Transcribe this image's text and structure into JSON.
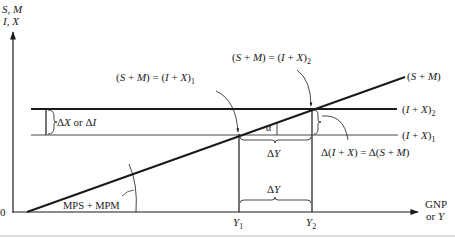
{
  "axes": {
    "y_label_line1": "S, M",
    "y_label_line2": "I, X",
    "x_label_line1": "GNP",
    "x_label_line2": "or Y",
    "origin": "0"
  },
  "lines": {
    "saving_import": "(S + M)",
    "inj_2": "(I + X)",
    "inj_2_sub": "2",
    "inj_1": "(I + X)",
    "inj_1_sub": "1"
  },
  "annotations": {
    "eq1": "(S + M) = (I + X)",
    "eq1_sub": "1",
    "eq2": "(S + M) = (I + X)",
    "eq2_sub": "2",
    "delta_x_or_i": "ΔX or ΔI",
    "alpha": "α",
    "delta_y_upper": "ΔY",
    "delta_y_lower": "ΔY",
    "delta_eq": "Δ(I + X) = Δ(S + M)",
    "slope": "MPS + MPM",
    "y1": "Y",
    "y1_sub": "1",
    "y2": "Y",
    "y2_sub": "2"
  },
  "colors": {
    "ink": "#1a1a1a",
    "rule": "#bdbdbd"
  }
}
